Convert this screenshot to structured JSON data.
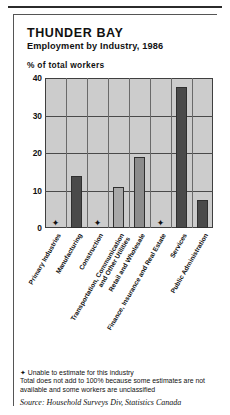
{
  "header": {
    "title": "THUNDER BAY",
    "subtitle": "Employment by Industry, 1986",
    "axis_note": "% of total workers"
  },
  "footnotes": {
    "star_symbol": "✦",
    "star_note": "Unable to estimate for this industry",
    "total_note": "Total does not add to 100% because some estimates are not available and some workers are unclassified",
    "source": "Source: Household Surveys Div, Statistics Canada"
  },
  "colors": {
    "plot_background": "#cccccc",
    "grid": "#4a4a4a",
    "bar_dark": "#4a4a4a",
    "bar_medium": "#8c8c8c",
    "bar_light": "#a8a8a8",
    "frame": "#555555",
    "text": "#111111"
  },
  "chart_data": {
    "type": "bar",
    "title": "Employment by Industry, 1986",
    "subtitle": "THUNDER BAY",
    "xlabel": "",
    "ylabel": "% of total workers",
    "ylim": [
      0,
      40
    ],
    "yticks": [
      0,
      10,
      20,
      30,
      40
    ],
    "grid": true,
    "legend": "none",
    "categories": [
      "Primary Industries",
      "Manufacturing",
      "Construction",
      "Transportation, Communication and Other Utilities",
      "Retail and Wholesale",
      "Finance, Insurance and Real Estate",
      "Services",
      "Public Administration"
    ],
    "category_lines": [
      [
        "Primary Industries"
      ],
      [
        "Manufacturing"
      ],
      [
        "Construction"
      ],
      [
        "Transportation, Communication",
        "and Other Utilities"
      ],
      [
        "Retail and Wholesale"
      ],
      [
        "Finance, Insurance and Real Estate"
      ],
      [
        "Services"
      ],
      [
        "Public Administration"
      ]
    ],
    "values": [
      null,
      14.0,
      null,
      11.0,
      19.0,
      null,
      37.5,
      7.5
    ],
    "value_labels": [
      "✦",
      "14.0",
      "✦",
      "11.0",
      "19.0",
      "✦",
      "37.5",
      "7.5"
    ],
    "bar_shades": [
      "none",
      "dark",
      "none",
      "light",
      "medium",
      "none",
      "dark",
      "dark"
    ],
    "unavailable_marker": "✦",
    "unavailable_categories": [
      "Primary Industries",
      "Construction",
      "Finance, Insurance and Real Estate"
    ]
  }
}
